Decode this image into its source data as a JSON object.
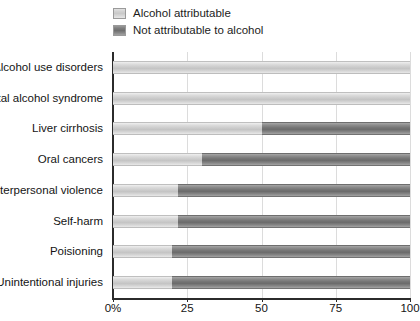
{
  "legend": {
    "position": "top-left-inside",
    "items": [
      {
        "label": "Alcohol attributable",
        "color": "#cccccc",
        "swatch_name": "legend-swatch-attributable"
      },
      {
        "label": "Not attributable to alcohol",
        "color": "#757575",
        "swatch_name": "legend-swatch-not-attributable"
      }
    ]
  },
  "chart_data": {
    "type": "bar",
    "orientation": "horizontal",
    "stacked": true,
    "normalized_percent": true,
    "title": "",
    "subtitle": "",
    "xlabel": "",
    "ylabel": "",
    "xlim": [
      0,
      100
    ],
    "ylim": null,
    "grid": true,
    "grid_axis": "x",
    "legend_position": "top-left",
    "xticks": [
      0,
      25,
      50,
      75,
      100
    ],
    "xtick_labels": [
      "0%",
      "25",
      "50",
      "75",
      "100"
    ],
    "categories": [
      "Alcohol use disorders",
      "Fetal alcohol syndrome",
      "Liver cirrhosis",
      "Oral cancers",
      "Interpersonal violence",
      "Self-harm",
      "Poisioning",
      "Unintentional injuries"
    ],
    "series": [
      {
        "name": "Alcohol attributable",
        "color": "#cccccc",
        "values": [
          100,
          100,
          50,
          30,
          22,
          22,
          20,
          20
        ]
      },
      {
        "name": "Not attributable to alcohol",
        "color": "#757575",
        "values": [
          0,
          0,
          50,
          70,
          78,
          78,
          80,
          80
        ]
      }
    ]
  }
}
